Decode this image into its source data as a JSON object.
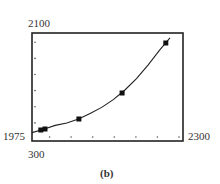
{
  "chart_data": {
    "type": "scatter",
    "title": "",
    "caption": "(b)",
    "xlabel": "",
    "ylabel": "",
    "window_labels": {
      "xmin": "1975",
      "xmax": "2300",
      "ymin": "300",
      "ymax": "2100"
    },
    "xlim": [
      1975,
      2300
    ],
    "ylim": [
      300,
      2100
    ],
    "x_tick_count": 7,
    "y_tick_count": 6,
    "grid": false,
    "series": [
      {
        "name": "data points",
        "marker": "square",
        "points": [
          {
            "x": 1994,
            "y": 483
          },
          {
            "x": 2003,
            "y": 500
          },
          {
            "x": 2076,
            "y": 667
          },
          {
            "x": 2169,
            "y": 1100
          },
          {
            "x": 2263,
            "y": 1933
          }
        ]
      },
      {
        "name": "fitted curve",
        "type": "line",
        "model": "exponential",
        "points": [
          {
            "x": 1975,
            "y": 440
          },
          {
            "x": 2000,
            "y": 495
          },
          {
            "x": 2025,
            "y": 560
          },
          {
            "x": 2050,
            "y": 600
          },
          {
            "x": 2075,
            "y": 665
          },
          {
            "x": 2100,
            "y": 760
          },
          {
            "x": 2125,
            "y": 860
          },
          {
            "x": 2150,
            "y": 990
          },
          {
            "x": 2175,
            "y": 1150
          },
          {
            "x": 2200,
            "y": 1340
          },
          {
            "x": 2225,
            "y": 1570
          },
          {
            "x": 2250,
            "y": 1820
          },
          {
            "x": 2272,
            "y": 2020
          }
        ]
      }
    ],
    "colors": {
      "frame": "#222222",
      "curve": "#222222",
      "marker": "#111111",
      "tick": "#555555"
    }
  }
}
